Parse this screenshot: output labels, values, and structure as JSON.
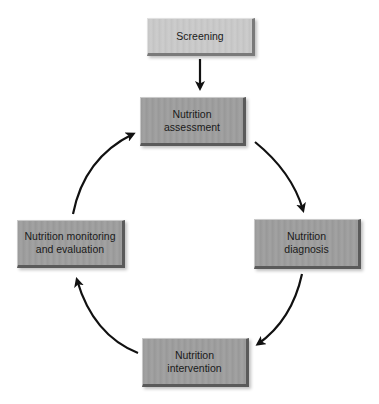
{
  "diagram": {
    "type": "cycle-flow",
    "nodes": {
      "screening": {
        "label": "Screening"
      },
      "assessment": {
        "label": "Nutrition\nassessment"
      },
      "diagnosis": {
        "label": "Nutrition\ndiagnosis"
      },
      "intervention": {
        "label": "Nutrition\nintervention"
      },
      "monitoring": {
        "label": "Nutrition monitoring\nand evaluation"
      }
    },
    "edges": [
      {
        "from": "screening",
        "to": "assessment"
      },
      {
        "from": "assessment",
        "to": "diagnosis"
      },
      {
        "from": "diagnosis",
        "to": "intervention"
      },
      {
        "from": "intervention",
        "to": "monitoring"
      },
      {
        "from": "monitoring",
        "to": "assessment"
      }
    ],
    "colors": {
      "box_fill_dark": "#9c9c9c",
      "box_fill_light": "#c8c8c8",
      "arrow": "#111111",
      "background": "#ffffff"
    }
  }
}
